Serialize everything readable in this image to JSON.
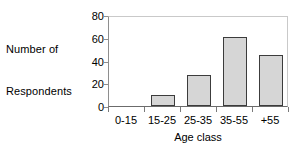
{
  "chart_data": {
    "type": "bar",
    "title": "",
    "categories": [
      "0-15",
      "15-25",
      "25-35",
      "35-55",
      "+55"
    ],
    "values": [
      0,
      10,
      27,
      61,
      45
    ],
    "xlabel": "Age class",
    "ylabel": "Number of Respondents",
    "ylabel_lines": [
      "Number of",
      "Respondents"
    ],
    "yticks": [
      0,
      20,
      40,
      60,
      80
    ],
    "ytick_labels": [
      "0",
      "20",
      "40",
      "60",
      "80"
    ],
    "ylim": [
      0,
      80
    ],
    "grid": false,
    "legend": false,
    "legend_position": "none",
    "bar_fill_color": "#d6d6d6",
    "bar_edge_color": "#3c3c3c",
    "axis_color": "#6b6b6b",
    "frame_color": "#c9c9c9",
    "text_color": "#000000"
  }
}
